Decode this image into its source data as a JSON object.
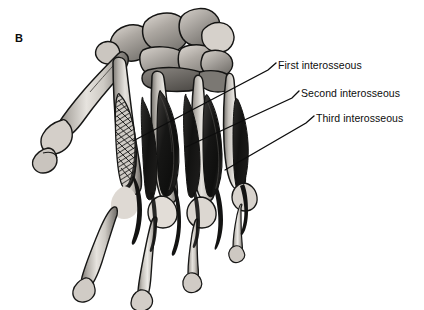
{
  "figure": {
    "panel_letter": "B",
    "background_color": "#ffffff",
    "ink_color": "#0d0d0d"
  },
  "callouts": [
    {
      "id": "first-interosseous",
      "label": "First interosseous",
      "text_x": 278,
      "text_y": 60,
      "leader": {
        "hook_x": 268,
        "hook_y": 70,
        "elbow_x": 276,
        "elbow_y": 63,
        "target_x": 133,
        "target_y": 141
      }
    },
    {
      "id": "second-interosseous",
      "label": "Second interosseous",
      "text_x": 301,
      "text_y": 88,
      "leader": {
        "hook_x": 292,
        "hook_y": 98,
        "elbow_x": 299,
        "elbow_y": 91,
        "target_x": 186,
        "target_y": 147
      }
    },
    {
      "id": "third-interosseous",
      "label": "Third interosseous",
      "text_x": 316,
      "text_y": 113,
      "leader": {
        "hook_x": 306,
        "hook_y": 123,
        "elbow_x": 314,
        "elbow_y": 116,
        "target_x": 225,
        "target_y": 170
      }
    }
  ],
  "palette": {
    "bone_light": "#e8e5e0",
    "bone_mid": "#bdb9b3",
    "bone_shadow": "#8e8a85",
    "bone_dark": "#6a6762",
    "muscle_dark": "#1b1b1b",
    "muscle_mid": "#4a4845",
    "outline": "#1a1a1a"
  }
}
